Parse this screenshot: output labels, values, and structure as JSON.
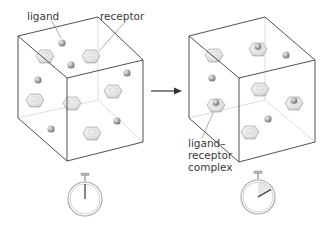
{
  "figure": {
    "labels": {
      "ligand": "ligand",
      "receptor": "receptor",
      "complex_line1": "ligand–",
      "complex_line2": "receptor",
      "complex_line3": "complex"
    },
    "colors": {
      "edge": "#3c3c3c",
      "hidden_edge": "#cfcfcf",
      "receptor_fill": "#e4e4e4",
      "ligand_fill": "#9a9a9a",
      "stopwatch": "#9c9c9c",
      "elapsed_wedge": "#e6e6e6",
      "text": "#3a3a3a"
    },
    "panels": [
      {
        "name": "before",
        "stopwatch_hand": "12 o'clock",
        "free_ligands": 7,
        "free_receptors": 6,
        "complexes": 0
      },
      {
        "name": "after",
        "stopwatch_hand": "about 2 o'clock",
        "free_ligands": 3,
        "free_receptors": 2,
        "complexes": 4
      }
    ],
    "arrow": "right-arrow"
  }
}
